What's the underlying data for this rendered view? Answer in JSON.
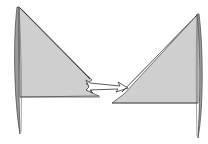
{
  "diagram": {
    "type": "fold-step",
    "colors": {
      "fill": "#cfcfcf",
      "stroke": "#4a4a4a",
      "arrow_fill": "#ffffff",
      "background": "#ffffff"
    },
    "left_shape": {
      "label": "flag-before"
    },
    "arrow": {
      "direction": "right"
    },
    "right_shape": {
      "label": "flag-after"
    }
  }
}
